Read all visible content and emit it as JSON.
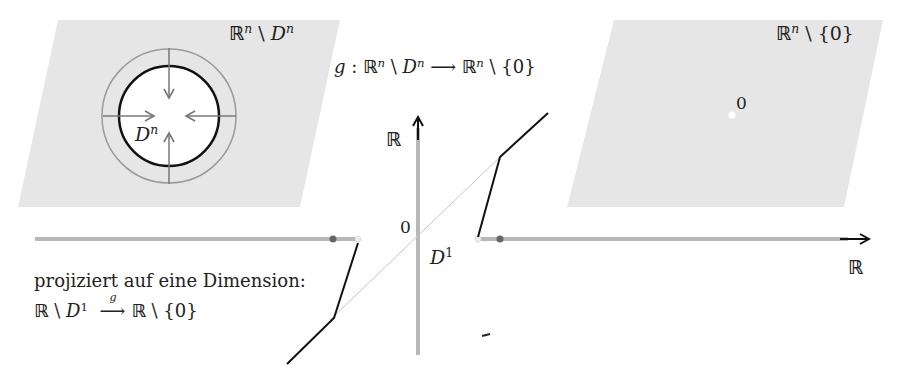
{
  "diagram": {
    "left_panel": {
      "label_set": "ℝ",
      "label_sup": "n",
      "label_minus": " \\ ",
      "label_D": "D",
      "label_D_sup": "n",
      "disk_label": "D",
      "disk_label_sup": "n",
      "fill_color": "#e6e6e6"
    },
    "right_panel": {
      "label_set": "ℝ",
      "label_sup": "n",
      "label_rest": " \\ {0}",
      "origin_label": "0",
      "fill_color": "#e6e6e6"
    },
    "map_title": {
      "g": "g",
      "colon": " : ",
      "R": "ℝ",
      "sup1": "n",
      "minus": " \\ ",
      "D": "D",
      "sup2": "n",
      "arrow": "  ⟶  ",
      "R2": "ℝ",
      "sup3": "n",
      "rest": " \\ {0}"
    },
    "axes": {
      "y_label": "ℝ",
      "x_label": "ℝ",
      "origin_label": "0",
      "interval_label": "D",
      "interval_sup": "1",
      "axis_color": "#b0b0b0",
      "graph_color": "#111111"
    },
    "caption": {
      "line1": "projiziert auf eine Dimension:",
      "l2_R": "ℝ",
      "l2_minus": " \\ ",
      "l2_D": "D",
      "l2_sup": "1",
      "l2_g": "g",
      "l2_arrow": "⟶",
      "l2_R2": "ℝ",
      "l2_rest": " \\ {0}"
    }
  }
}
